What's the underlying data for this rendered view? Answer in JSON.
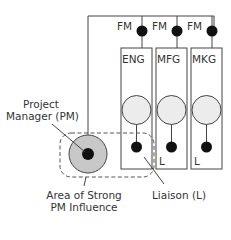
{
  "diagram": {
    "type": "organizational-structure",
    "functional_managers": [
      "FM",
      "FM",
      "FM"
    ],
    "departments": [
      "ENG",
      "MFG",
      "MKG"
    ],
    "liaison_marks": [
      "L",
      "L"
    ],
    "labels": {
      "project_manager_line1": "Project",
      "project_manager_line2": "Manager (PM)",
      "area_line1": "Area of Strong",
      "area_line2": "PM Influence",
      "liaison": "Liaison (L)"
    },
    "colors": {
      "line": "#444444",
      "dot": "#111111",
      "member_fill": "#ececec",
      "pm_fill": "#c8c8c8",
      "dash": "#555555"
    }
  }
}
